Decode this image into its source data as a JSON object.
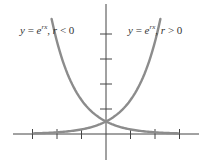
{
  "chart_data": {
    "type": "line",
    "title": "",
    "xlabel": "",
    "ylabel": "",
    "grid": false,
    "legend_position": "annotations near curves",
    "axes": {
      "x_ticks": [
        -3,
        -2,
        -1,
        1,
        2,
        3
      ],
      "y_ticks": [
        1,
        2,
        3,
        4
      ],
      "xlim": [
        -3.9,
        3.8
      ],
      "ylim": [
        -1.0,
        5.2
      ],
      "tick_labels_shown": false
    },
    "series": [
      {
        "name": "y = e^{rx}, r < 0",
        "label_parts": {
          "lhs": "y",
          "eq": " = ",
          "base": "e",
          "exp": "rx",
          "cond_var": "r",
          "cond": " < 0"
        },
        "color": "#8c8c8c",
        "function": "exp(-x)",
        "x": [
          -3,
          -2.5,
          -2,
          -1.5,
          -1,
          -0.5,
          0,
          0.5,
          1,
          1.5,
          2,
          2.5,
          3
        ],
        "y": [
          20.09,
          12.18,
          7.39,
          4.48,
          2.72,
          1.65,
          1.0,
          0.61,
          0.37,
          0.22,
          0.14,
          0.08,
          0.05
        ]
      },
      {
        "name": "y = e^{rx}, r > 0",
        "label_parts": {
          "lhs": "y",
          "eq": " = ",
          "base": "e",
          "exp": "rx",
          "cond_var": "r",
          "cond": " > 0"
        },
        "color": "#8c8c8c",
        "function": "exp(x)",
        "x": [
          -3,
          -2.5,
          -2,
          -1.5,
          -1,
          -0.5,
          0,
          0.5,
          1,
          1.5,
          2,
          2.5,
          3
        ],
        "y": [
          0.05,
          0.08,
          0.14,
          0.22,
          0.37,
          0.61,
          1.0,
          1.65,
          2.72,
          4.48,
          7.39,
          12.18,
          20.09
        ]
      }
    ],
    "annotations": [
      {
        "text": "y = e^{rx}, r < 0",
        "position": "upper-left"
      },
      {
        "text": "y = e^{rx}, r > 0",
        "position": "upper-right"
      }
    ],
    "intersection": {
      "x": 0,
      "y": 1
    }
  }
}
